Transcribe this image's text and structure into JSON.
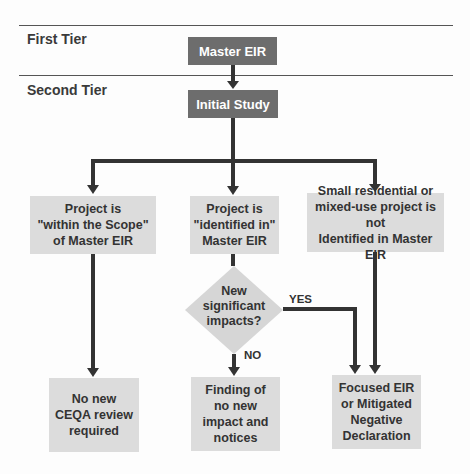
{
  "tiers": {
    "first": "First Tier",
    "second": "Second Tier"
  },
  "nodes": {
    "master_eir": "Master EIR",
    "initial_study": "Initial Study",
    "within_scope": "Project is\n\"within the Scope\"\nof Master EIR",
    "identified_in": "Project is\n\"identified in\"\nMaster EIR",
    "not_identified": "Small residential or\nmixed-use project is not\nIdentified in Master EIR",
    "decision": "New\nsignificant\nimpacts?",
    "no_review": "No new\nCEQA review\nrequired",
    "finding": "Finding of\nno new\nimpact and\nnotices",
    "focused_eir": "Focused EIR\nor Mitigated\nNegative\nDeclaration"
  },
  "edge_labels": {
    "yes": "YES",
    "no": "NO"
  },
  "colors": {
    "dark_box": "#6d6d6d",
    "light_box": "#dcdcdc",
    "arrow": "#333333",
    "rule": "#555555"
  }
}
